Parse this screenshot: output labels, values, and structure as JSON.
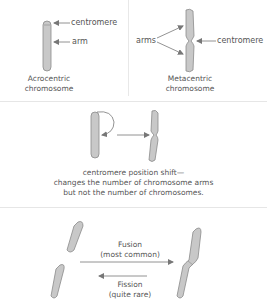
{
  "panels": {
    "acrocentric": {
      "labels": {
        "centromere": "centromere",
        "arm": "arm"
      },
      "caption_line1": "Acrocentric",
      "caption_line2": "chromosome"
    },
    "metacentric": {
      "labels": {
        "arms": "arms",
        "centromere": "centromere"
      },
      "caption_line1": "Metacentric",
      "caption_line2": "chromosome"
    },
    "shift": {
      "caption_line1": "centromere position shift—",
      "caption_line2": "changes the number of chromosome arms",
      "caption_line3": "but not the number of chromosomes."
    },
    "fusion_fission": {
      "fusion_line1": "Fusion",
      "fusion_line2": "(most common)",
      "fission_line1": "Fission",
      "fission_line2": "(quite rare)"
    }
  },
  "colors": {
    "chromosome_fill": "#c8c8c8",
    "chromosome_stroke": "#8a8a8a",
    "arrow": "#777777",
    "divider": "#e6e6e6",
    "text": "#555555"
  }
}
